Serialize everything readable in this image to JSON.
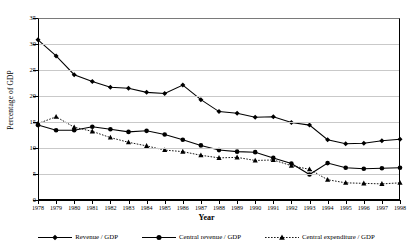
{
  "chart_data": {
    "type": "line",
    "title": "",
    "xlabel": "Year",
    "ylabel": "Percentage of GDP",
    "ylim": [
      0,
      35
    ],
    "ytick_values": [
      0,
      5,
      10,
      15,
      20,
      25,
      30,
      35
    ],
    "ytick_labels": [
      "0",
      "5",
      "10",
      "15",
      "20",
      "25",
      "30",
      "35"
    ],
    "grid": true,
    "legend_position": "bottom",
    "categories": [
      "1978",
      "1979",
      "1980",
      "1981",
      "1982",
      "1983",
      "1984",
      "1985",
      "1986",
      "1987",
      "1988",
      "1989",
      "1990",
      "1991",
      "1992",
      "1993",
      "1994",
      "1995",
      "1996",
      "1997",
      "1998"
    ],
    "series": [
      {
        "name": "Revenue / GDP",
        "marker": "diamond",
        "linestyle": "solid",
        "color": "#000000",
        "values": [
          30.8,
          27.7,
          24.1,
          22.8,
          21.7,
          21.5,
          20.7,
          20.5,
          22.1,
          19.3,
          17.0,
          16.7,
          15.9,
          16.0,
          14.9,
          14.4,
          11.6,
          10.8,
          10.9,
          11.4,
          11.7
        ]
      },
      {
        "name": "Central revenue / GDP",
        "marker": "circle",
        "linestyle": "solid",
        "color": "#000000",
        "values": [
          14.4,
          13.4,
          13.4,
          14.1,
          13.6,
          13.1,
          13.3,
          12.6,
          11.6,
          10.5,
          9.6,
          9.3,
          9.2,
          8.1,
          7.0,
          4.9,
          7.1,
          6.2,
          6.0,
          6.1,
          6.2
        ]
      },
      {
        "name": "Central expenditure / GDP",
        "marker": "triangle",
        "linestyle": "dotted",
        "color": "#000000",
        "values": [
          14.7,
          16.0,
          14.0,
          13.2,
          12.0,
          11.1,
          10.4,
          9.6,
          9.3,
          8.6,
          8.1,
          8.2,
          7.6,
          7.7,
          6.6,
          5.9,
          3.9,
          3.3,
          3.2,
          3.1,
          3.3
        ]
      }
    ]
  },
  "legend": {
    "items": [
      {
        "label": "Revenue / GDP",
        "marker": "diamond",
        "linestyle": "solid"
      },
      {
        "label": "Central revenue / GDP",
        "marker": "circle",
        "linestyle": "solid"
      },
      {
        "label": "Central expenditure / GDP",
        "marker": "triangle",
        "linestyle": "dotted"
      }
    ]
  }
}
